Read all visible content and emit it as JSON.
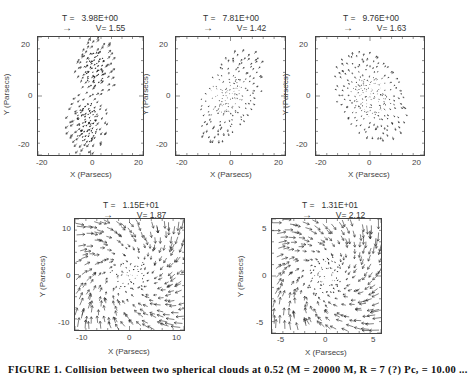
{
  "figure": {
    "caption": "FIGURE 1. Collision between two spherical clouds at 0.52 (M = 20000 M, R = 7 (?) Pc, = 10.00 ..."
  },
  "chart_data": [
    {
      "type": "quiver",
      "title": "T = 3.98E+00",
      "reference_vector_label": "V= 1.55",
      "xlabel": "X (Parsecs)",
      "ylabel": "Y (Parsecs)",
      "xlim": [
        -25,
        25
      ],
      "ylim": [
        -25,
        25
      ],
      "xticks": [
        -20,
        0,
        20
      ],
      "yticks": [
        -20,
        0,
        20
      ],
      "field": "two_colliding_clouds"
    },
    {
      "type": "quiver",
      "title": "T = 7.81E+00",
      "reference_vector_label": "V= 1.42",
      "xlabel": "X (Parsecs)",
      "ylabel": "Y (Parsecs)",
      "xlim": [
        -25,
        25
      ],
      "ylim": [
        -25,
        25
      ],
      "xticks": [
        -20,
        0,
        20
      ],
      "yticks": [
        -20,
        0,
        20
      ],
      "field": "merging_elongated"
    },
    {
      "type": "quiver",
      "title": "T = 9.76E+00",
      "reference_vector_label": "V= 1.63",
      "xlabel": "X (Parsecs)",
      "ylabel": "Y (Parsecs)",
      "xlim": [
        -25,
        25
      ],
      "ylim": [
        -25,
        25
      ],
      "xticks": [
        -20,
        0,
        20
      ],
      "yticks": [
        -20,
        0,
        20
      ],
      "field": "central_concentration"
    },
    {
      "type": "quiver",
      "title": "T = 1.15E+01",
      "reference_vector_label": "V= 1.87",
      "xlabel": "X (Parsecs)",
      "ylabel": "Y (Parsecs)",
      "xlim": [
        -12,
        12
      ],
      "ylim": [
        -12,
        12
      ],
      "xticks": [
        -10,
        0,
        10
      ],
      "yticks": [
        -10,
        0,
        10
      ],
      "field": "spiral_infall"
    },
    {
      "type": "quiver",
      "title": "T = 1.31E+01",
      "reference_vector_label": "V= 2.12",
      "xlabel": "X (Parsecs)",
      "ylabel": "Y (Parsecs)",
      "xlim": [
        -6,
        6
      ],
      "ylim": [
        -6,
        6
      ],
      "xticks": [
        -5,
        0,
        5
      ],
      "yticks": [
        -5,
        0,
        5
      ],
      "field": "spiral_infall_tight"
    }
  ],
  "panels": [
    {
      "title_t": "T =",
      "title_val": "3.98E+00",
      "ref_arrow": "→",
      "ref_v": "V= 1.55",
      "xt": [
        "-20",
        "0",
        "20"
      ],
      "yt": [
        "20",
        "0",
        "-20"
      ],
      "xlabel": "X (Parsecs)",
      "ylabel": "Y (Parsecs)"
    },
    {
      "title_t": "T =",
      "title_val": "7.81E+00",
      "ref_arrow": "→",
      "ref_v": "V= 1.42",
      "xt": [
        "-20",
        "0",
        "20"
      ],
      "yt": [
        "20",
        "0",
        "-20"
      ],
      "xlabel": "X (Parsecs)",
      "ylabel": "Y (Parsecs)"
    },
    {
      "title_t": "T =",
      "title_val": "9.76E+00",
      "ref_arrow": "→",
      "ref_v": "V= 1.63",
      "xt": [
        "-20",
        "0",
        "20"
      ],
      "yt": [
        "20",
        "0",
        "-20"
      ],
      "xlabel": "X (Parsecs)",
      "ylabel": "Y (Parsecs)"
    },
    {
      "title_t": "T =",
      "title_val": "1.15E+01",
      "ref_arrow": "→",
      "ref_v": "V= 1.87",
      "xt": [
        "-10",
        "0",
        "10"
      ],
      "yt": [
        "10",
        "0",
        "-10"
      ],
      "xlabel": "X (Parsecs)",
      "ylabel": "Y (Parsecs)"
    },
    {
      "title_t": "T =",
      "title_val": "1.31E+01",
      "ref_arrow": "→",
      "ref_v": "V= 2.12",
      "xt": [
        "-5",
        "0",
        "5"
      ],
      "yt": [
        "5",
        "0",
        "-5"
      ],
      "xlabel": "X (Parsecs)",
      "ylabel": "Y (Parsecs)"
    }
  ]
}
